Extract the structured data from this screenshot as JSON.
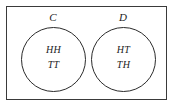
{
  "diagram": {
    "type": "venn-diagram",
    "universe": {
      "border_color": "#3a3a3a",
      "background_color": "#ffffff"
    },
    "sets": [
      {
        "label": "C",
        "stroke_color": "#2b2b2b",
        "elements": [
          "HH",
          "TT"
        ]
      },
      {
        "label": "D",
        "stroke_color": "#2b2b2b",
        "elements": [
          "HT",
          "TH"
        ]
      }
    ]
  }
}
